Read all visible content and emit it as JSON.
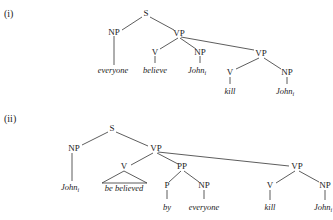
{
  "trees": [
    {
      "label": "(i)",
      "nodes": {
        "S": "S",
        "NP": "NP",
        "VP": "VP",
        "V": "V",
        "NP_obj": "NP",
        "VP2": "VP",
        "V2": "V",
        "NP2": "NP"
      },
      "words": {
        "subject": "everyone",
        "verb": "believe",
        "object": "John",
        "object_index": "i",
        "verb2": "kill",
        "object2": "John",
        "object2_index": "i"
      }
    },
    {
      "label": "(ii)",
      "nodes": {
        "S": "S",
        "NP": "NP",
        "VP": "VP",
        "V": "V",
        "PP": "PP",
        "P": "P",
        "NP_by": "NP",
        "VP2": "VP",
        "V2": "V",
        "NP2": "NP"
      },
      "words": {
        "subject": "John",
        "subject_index": "i",
        "verb": "be believed",
        "prep": "by",
        "by_object": "everyone",
        "verb2": "kill",
        "object2": "John",
        "object2_index": "i"
      }
    }
  ]
}
